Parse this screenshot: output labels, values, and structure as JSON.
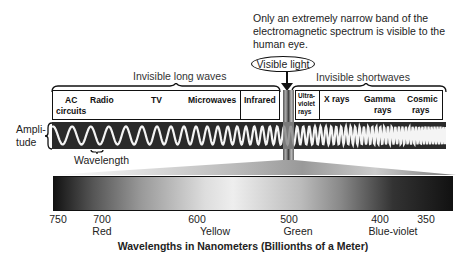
{
  "note": "Only an extremely narrow band of the electromagnetic spectrum is visible to the human eye.",
  "visible_light_label": "Visible light",
  "groups": {
    "long": "Invisible long waves",
    "short": "Invisible shortwaves"
  },
  "bands": {
    "ac": [
      "AC",
      "circuits"
    ],
    "radio": "Radio",
    "tv": "TV",
    "microwaves": "Microwaves",
    "infrared": "Infrared",
    "uv": [
      "Ultra-",
      "violet",
      "rays"
    ],
    "xrays": "X rays",
    "gamma": [
      "Gamma",
      "rays"
    ],
    "cosmic": [
      "Cosmic",
      "rays"
    ]
  },
  "amplitude_label": [
    "Ampli-",
    "tude"
  ],
  "wavelength_label": "Wavelength",
  "scale": {
    "ticks": [
      "750",
      "700",
      "600",
      "500",
      "400",
      "350"
    ],
    "colors": [
      "Red",
      "Yellow",
      "Green",
      "Blue-violet"
    ],
    "title": "Wavelengths in Nanometers (Billionths of a Meter)"
  }
}
